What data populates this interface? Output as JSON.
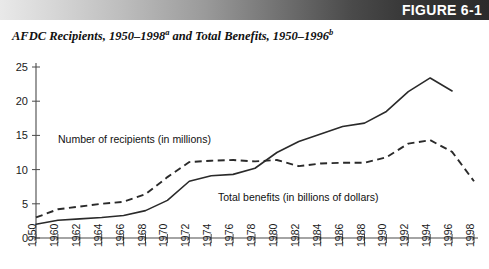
{
  "banner": {
    "label": "FIGURE 6-1"
  },
  "title": {
    "part1": "AFDC Recipients, 1950–1998",
    "sup1": "a",
    "part2": " and Total Benefits, 1950–1996",
    "sup2": "b"
  },
  "chart_data": {
    "type": "line",
    "title": "AFDC Recipients, 1950–1998a and Total Benefits, 1950–1996b",
    "xlabel": "",
    "ylabel": "",
    "ylim": [
      0,
      25
    ],
    "yticks": [
      0,
      5,
      10,
      15,
      20,
      25
    ],
    "grid": false,
    "legend_position": "inline-annotation",
    "x": [
      1950,
      1960,
      1962,
      1964,
      1966,
      1968,
      1970,
      1972,
      1974,
      1976,
      1978,
      1980,
      1982,
      1984,
      1986,
      1988,
      1990,
      1992,
      1994,
      1996,
      1998
    ],
    "xtick_labels": [
      "1950",
      "1960",
      "1962",
      "1964",
      "1966",
      "1968",
      "1970",
      "1972",
      "1974",
      "1976",
      "1978",
      "1980",
      "1982",
      "1984",
      "1986",
      "1988",
      "1990",
      "1992",
      "1994",
      "1996",
      "1998"
    ],
    "series": [
      {
        "name": "Number of recipients (in millions)",
        "style": "dashed",
        "annotation": "Number of recipients (in millions)",
        "values": [
          3.0,
          4.2,
          4.6,
          5.0,
          5.3,
          6.4,
          8.9,
          11.1,
          11.3,
          11.4,
          11.2,
          11.4,
          10.5,
          10.9,
          11.0,
          11.0,
          11.8,
          13.8,
          14.3,
          12.6,
          8.3
        ]
      },
      {
        "name": "Total benefits (in billions of dollars)",
        "style": "solid",
        "annotation": "Total benefits (in billions of dollars)",
        "values": [
          2.0,
          2.6,
          2.8,
          3.0,
          3.3,
          4.0,
          5.5,
          8.3,
          9.1,
          9.3,
          10.2,
          12.5,
          14.1,
          15.2,
          16.3,
          16.8,
          18.5,
          21.4,
          23.4,
          21.5,
          null
        ]
      }
    ],
    "annotations": [
      {
        "text": "Number of recipients (in millions)",
        "x_px": 58,
        "y_px": 91
      },
      {
        "text": "Total benefits (in billions of dollars)",
        "x_px": 218,
        "y_px": 149
      }
    ]
  }
}
